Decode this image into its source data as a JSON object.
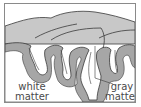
{
  "diagram": {
    "title": "",
    "labels": {
      "white_matter_line1": "white",
      "white_matter_line2": "matter",
      "gray_matter_line1": "gray",
      "gray_matter_line2": "matter"
    },
    "colors": {
      "gray_matter": "#a6a6a6",
      "white_matter_top": "#c8c8c8",
      "outline": "#3a3a3a",
      "background": "#ffffff",
      "frame": "#8a8a8a"
    }
  }
}
